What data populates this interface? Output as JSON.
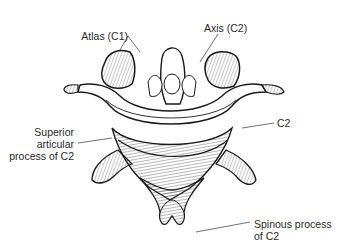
{
  "figure": {
    "labels": {
      "atlas": "Atlas (C1)",
      "axis": "Axis (C2)",
      "superior_articular_line1": "Superior",
      "superior_articular_line2": "articular",
      "superior_articular_line3": "process of C2",
      "c2": "C2",
      "spinous_line1": "Spinous process",
      "spinous_line2": "of C2"
    },
    "colors": {
      "ink": "#1a1a1a",
      "background": "#ffffff",
      "text": "#2a2a2a"
    }
  }
}
